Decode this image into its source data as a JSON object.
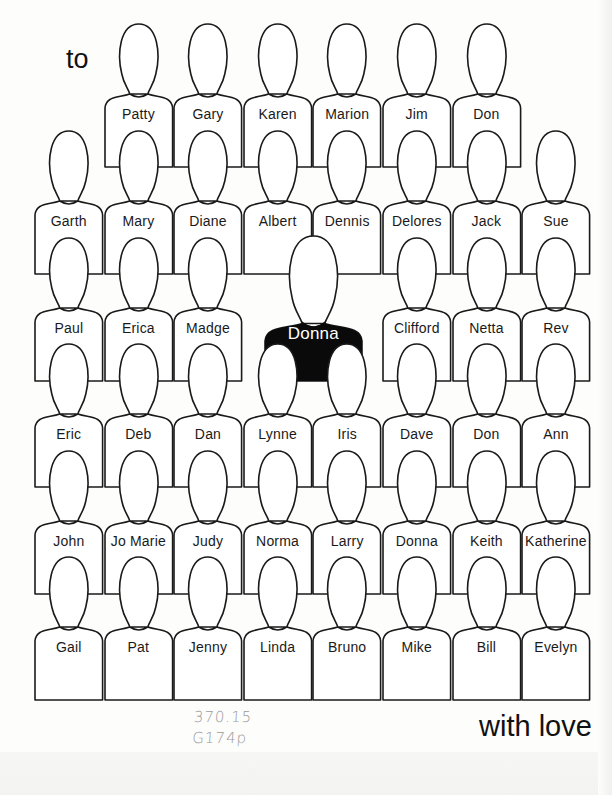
{
  "header": {
    "to_label": "to"
  },
  "footer": {
    "closing_label": "with love",
    "call_number": [
      "370.15",
      "G174p"
    ]
  },
  "colors": {
    "outline": "#1a1a1a",
    "figure_fill": "#ffffff",
    "highlight_fill": "#0a0a0a",
    "highlight_text": "#ffffff",
    "pencil": "#9a9a9a"
  },
  "highlight": {
    "name": "Donna",
    "row": 2,
    "cols": [
      3,
      4
    ]
  },
  "rows": [
    {
      "names": [
        null,
        "Patty",
        "Gary",
        "Karen",
        "Marion",
        "Jim",
        "Don",
        null
      ]
    },
    {
      "names": [
        "Garth",
        "Mary",
        "Diane",
        "Albert",
        "Dennis",
        "Delores",
        "Jack",
        "Sue"
      ]
    },
    {
      "names": [
        "Paul",
        "Erica",
        "Madge",
        null,
        null,
        "Clifford",
        "Netta",
        "Rev"
      ]
    },
    {
      "names": [
        "Eric",
        "Deb",
        "Dan",
        "Lynne",
        "Iris",
        "Dave",
        "Don",
        "Ann"
      ]
    },
    {
      "names": [
        "John",
        "Jo Marie",
        "Judy",
        "Norma",
        "Larry",
        "Donna",
        "Keith",
        "Katherine"
      ]
    },
    {
      "names": [
        "Gail",
        "Pat",
        "Jenny",
        "Linda",
        "Bruno",
        "Mike",
        "Bill",
        "Evelyn"
      ]
    }
  ]
}
